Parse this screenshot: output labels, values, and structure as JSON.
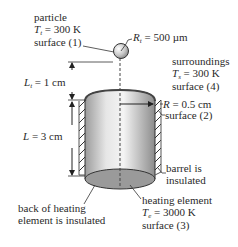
{
  "particle": {
    "title": "particle",
    "temp_symbol": "T",
    "temp_sub": "t",
    "temp_value": " = 300 K",
    "surface": "surface (1)",
    "radius_symbol": "R",
    "radius_sub": "t",
    "radius_value": " = 500 µm"
  },
  "surroundings": {
    "title": "surroundings",
    "temp_symbol": "T",
    "temp_sub": "s",
    "temp_value": " = 300 K",
    "surface": "surface (4)"
  },
  "dimensions": {
    "gap_symbol": "L",
    "gap_sub": "t",
    "gap_value": " = 1 cm",
    "length_symbol": "L",
    "length_value": " = 3 cm",
    "radius_symbol": "R",
    "radius_value": " = 0.5 cm"
  },
  "barrel": {
    "surface": "surface (2)",
    "note_line1": "barrel is",
    "note_line2": "insulated"
  },
  "heating_element": {
    "title": "heating element",
    "temp_symbol": "T",
    "temp_sub": "e",
    "temp_value": " = 3000 K",
    "surface": "surface (3)",
    "back_note_line1": "back of heating",
    "back_note_line2": "element is insulated"
  },
  "colors": {
    "cylinder_light": "#e8e8e8",
    "cylinder_dark": "#8a8a8a",
    "ellipse_fill": "#9a9a9a",
    "stroke": "#333333",
    "particle_fill": "#d0d0d0"
  }
}
